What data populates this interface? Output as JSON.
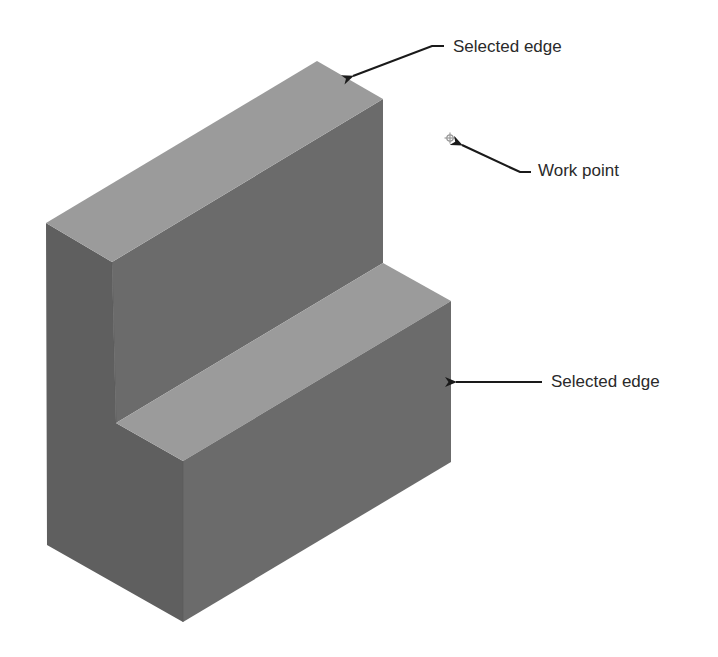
{
  "figure": {
    "type": "isometric-block-diagram",
    "labels": [
      {
        "id": "selected-edge-top",
        "text": "Selected edge",
        "x": 453,
        "y": 38
      },
      {
        "id": "work-point",
        "text": "Work point",
        "x": 538,
        "y": 162
      },
      {
        "id": "selected-edge-right",
        "text": "Selected edge",
        "x": 551,
        "y": 373
      }
    ],
    "colors": {
      "top_face": "#9b9b9b",
      "front_face": "#6b6b6b",
      "left_face": "#5f5f5f",
      "arrow": "#1a1a1a",
      "work_point": "#9a9a9a",
      "background": "#ffffff"
    },
    "work_point": {
      "x": 450,
      "y": 138,
      "icon": "crosshair-circle-icon"
    }
  }
}
